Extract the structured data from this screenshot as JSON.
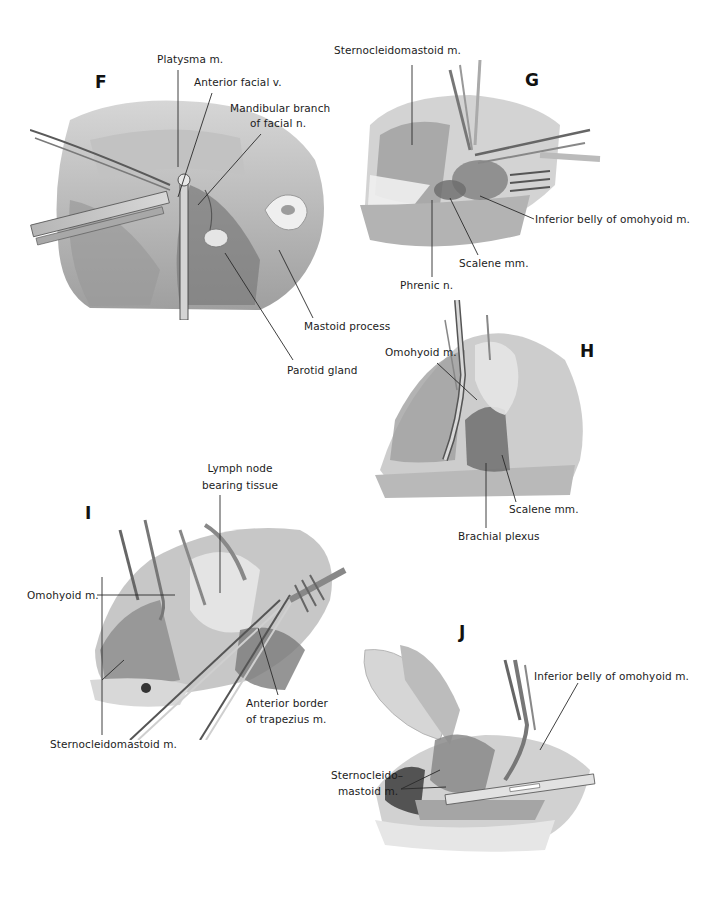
{
  "figure": {
    "panels": [
      {
        "id": "F",
        "letter": "F",
        "labels": [
          {
            "key": "platysma",
            "text": "Platysma m."
          },
          {
            "key": "anterior_facial_v",
            "text": "Anterior facial v."
          },
          {
            "key": "mandibular_branch_1",
            "text": "Mandibular branch"
          },
          {
            "key": "mandibular_branch_2",
            "text": "of facial n."
          },
          {
            "key": "mastoid_process",
            "text": "Mastoid process"
          },
          {
            "key": "parotid_gland",
            "text": "Parotid gland"
          }
        ]
      },
      {
        "id": "G",
        "letter": "G",
        "labels": [
          {
            "key": "sternocleidomastoid",
            "text": "Sternocleidomastoid m."
          },
          {
            "key": "inferior_belly_omohyoid",
            "text": "Inferior belly of omohyoid m."
          },
          {
            "key": "scalene",
            "text": "Scalene mm."
          },
          {
            "key": "phrenic",
            "text": "Phrenic n."
          }
        ]
      },
      {
        "id": "H",
        "letter": "H",
        "labels": [
          {
            "key": "omohyoid",
            "text": "Omohyoid m."
          },
          {
            "key": "scalene",
            "text": "Scalene mm."
          },
          {
            "key": "brachial_plexus",
            "text": "Brachial plexus"
          }
        ]
      },
      {
        "id": "I",
        "letter": "I",
        "labels": [
          {
            "key": "lymph_node_1",
            "text": "Lymph node"
          },
          {
            "key": "lymph_node_2",
            "text": "bearing tissue"
          },
          {
            "key": "omohyoid",
            "text": "Omohyoid m."
          },
          {
            "key": "anterior_border_1",
            "text": "Anterior border"
          },
          {
            "key": "anterior_border_2",
            "text": "of trapezius m."
          },
          {
            "key": "sternocleidomastoid",
            "text": "Sternocleidomastoid m."
          }
        ]
      },
      {
        "id": "J",
        "letter": "J",
        "labels": [
          {
            "key": "inferior_belly_omohyoid",
            "text": "Inferior belly of omohyoid m."
          },
          {
            "key": "scm_1",
            "text": "Sternocleido–"
          },
          {
            "key": "scm_2",
            "text": "mastoid m."
          }
        ]
      }
    ]
  }
}
